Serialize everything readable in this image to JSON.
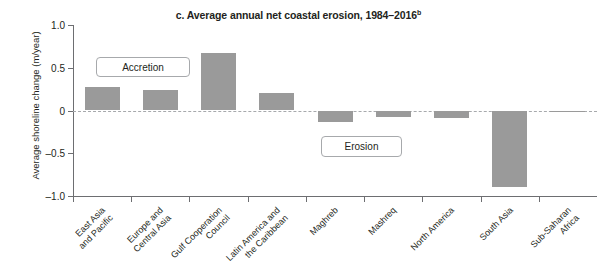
{
  "chart_data": {
    "type": "bar",
    "title": "c. Average annual net coastal erosion, 1984–2016",
    "title_superscript": "b",
    "xlabel": "",
    "ylabel": "Average shoreline change (m/year)",
    "ylim": [
      -1.0,
      1.0
    ],
    "ytick_labels": [
      "1.0",
      "0.5",
      "0",
      "–0.5",
      "–1.0"
    ],
    "ytick_values": [
      1.0,
      0.5,
      0,
      -0.5,
      -1.0
    ],
    "grid": false,
    "legend": "none",
    "zero_line": true,
    "bar_color": "#9a9a9a",
    "categories": [
      "East Asia and Pacific",
      "Europe and Central Asia",
      "Gulf Cooperation Council",
      "Latin America and the Caribbean",
      "Maghreb",
      "Mashreq",
      "North America",
      "South Asia",
      "Sub-Saharan Africa"
    ],
    "category_lines": [
      [
        "East Asia",
        "and Pacific"
      ],
      [
        "Europe and",
        "Central Asia"
      ],
      [
        "Gulf Cooperation",
        "Council"
      ],
      [
        "Latin America and",
        "the Caribbean"
      ],
      [
        "Maghreb"
      ],
      [
        "Mashreq"
      ],
      [
        "North America"
      ],
      [
        "South Asia"
      ],
      [
        "Sub-Saharan",
        "Africa"
      ]
    ],
    "values": [
      0.28,
      0.24,
      0.67,
      0.2,
      -0.14,
      -0.08,
      -0.09,
      -0.89,
      -0.02
    ],
    "annotations": [
      {
        "text": "Accretion",
        "region": "positive"
      },
      {
        "text": "Erosion",
        "region": "negative"
      }
    ]
  }
}
